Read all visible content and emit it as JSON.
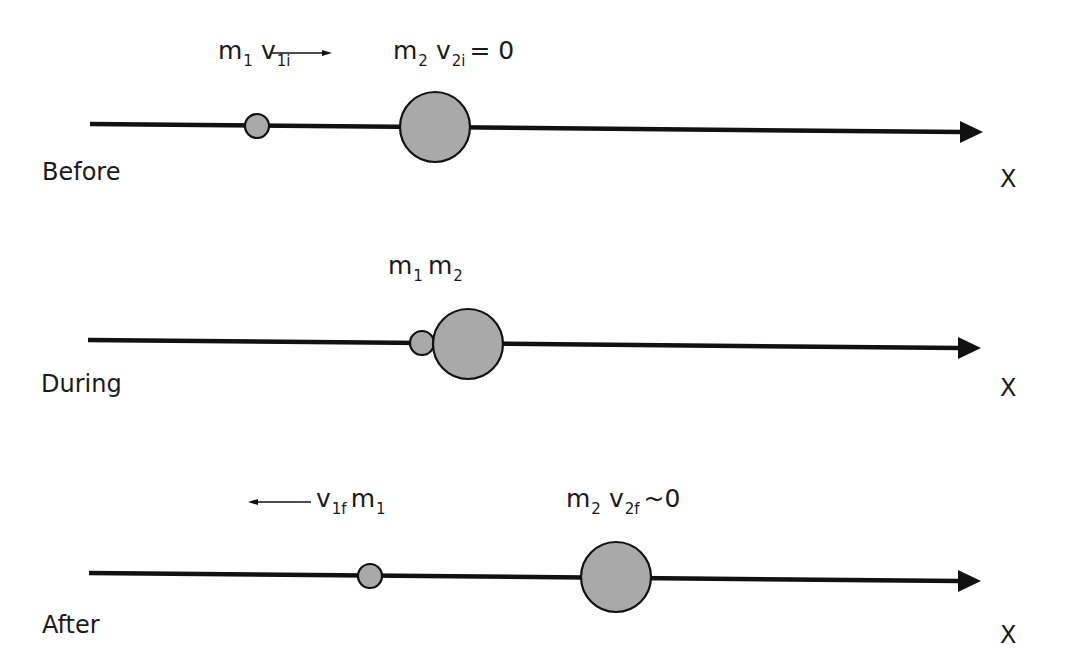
{
  "colors": {
    "axis": "#111111",
    "ball_fill": "#a9a9a9",
    "ball_stroke": "#111111",
    "text": "#1a1a1a",
    "background": "#ffffff"
  },
  "rows": [
    {
      "stage": "Before",
      "axis_label": "X",
      "annotations": {
        "m1": "m",
        "m1_sub": "1",
        "v1": "v",
        "v1_sub": "1i",
        "m2": "m",
        "m2_sub": "2",
        "v2": "v",
        "v2_sub": "2i",
        "v2_value": "= 0",
        "arrow_direction": "right"
      },
      "balls": [
        {
          "name": "m1",
          "cx": 257,
          "cy": 126,
          "r": 12
        },
        {
          "name": "m2",
          "cx": 435,
          "cy": 127,
          "r": 35
        }
      ]
    },
    {
      "stage": "During",
      "axis_label": "X",
      "annotations": {
        "m1": "m",
        "m1_sub": "1",
        "m2": "m",
        "m2_sub": "2"
      },
      "balls": [
        {
          "name": "m1",
          "cx": 422,
          "cy": 343,
          "r": 12
        },
        {
          "name": "m2",
          "cx": 468,
          "cy": 344,
          "r": 35
        }
      ]
    },
    {
      "stage": "After",
      "axis_label": "X",
      "annotations": {
        "v1": "v",
        "v1_sub": "1f",
        "m1": "m",
        "m1_sub": "1",
        "m2": "m",
        "m2_sub": "2",
        "v2": "v",
        "v2_sub": "2f",
        "v2_value": "~0",
        "arrow_direction": "left"
      },
      "balls": [
        {
          "name": "m1",
          "cx": 370,
          "cy": 576,
          "r": 12
        },
        {
          "name": "m2",
          "cx": 616,
          "cy": 577,
          "r": 35
        }
      ]
    }
  ]
}
